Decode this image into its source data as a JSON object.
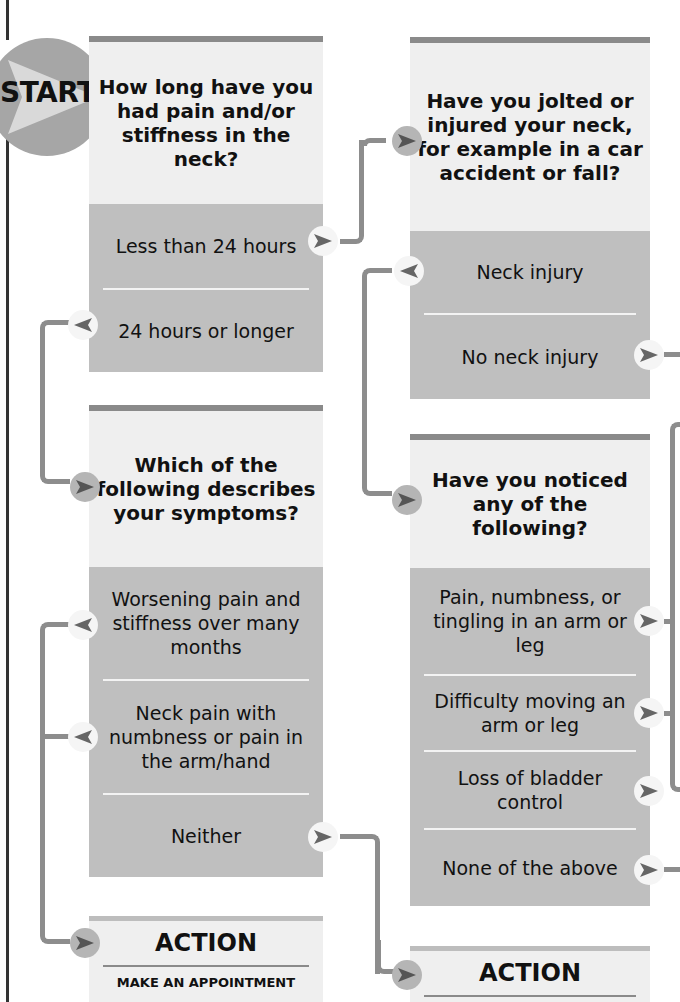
{
  "start": {
    "label": "START"
  },
  "colors": {
    "question_bg": "#efefef",
    "answer_bg": "#bfbfbf",
    "bar": "#8a8a8a",
    "connector": "#8d8d8d"
  },
  "q1": {
    "question": "How long have you had pain and/or stiffness in the neck?",
    "answers": [
      "Less than 24 hours",
      "24 hours or longer"
    ]
  },
  "q2": {
    "question": "Have you jolted or injured your neck, for example in a car accident or fall?",
    "answers": [
      "Neck injury",
      "No neck injury"
    ]
  },
  "q3": {
    "question": "Which of the following describes your symptoms?",
    "answers": [
      "Worsening pain and stiffness over many months",
      "Neck pain with numbness or pain in the arm/hand",
      "Neither"
    ]
  },
  "q4": {
    "question": "Have you noticed any of the following?",
    "answers": [
      "Pain, numbness, or tingling in an arm or leg",
      "Difficulty moving an arm or leg",
      "Loss of bladder control",
      "None of the above"
    ]
  },
  "action_left": {
    "title": "ACTION",
    "text": "MAKE AN APPOINTMENT"
  },
  "action_right": {
    "title": "ACTION"
  }
}
